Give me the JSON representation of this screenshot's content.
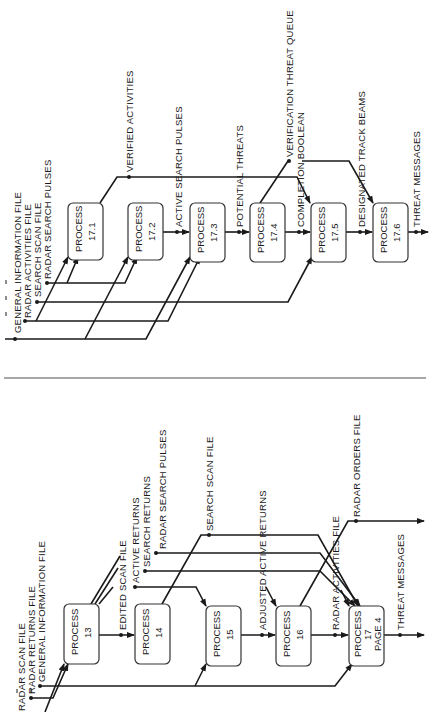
{
  "top_diagram": {
    "processes": [
      {
        "id": "17.1",
        "line1": "PROCESS",
        "line2": "17.1"
      },
      {
        "id": "17.2",
        "line1": "PROCESS",
        "line2": "17.2"
      },
      {
        "id": "17.3",
        "line1": "PROCESS",
        "line2": "17.3"
      },
      {
        "id": "17.4",
        "line1": "PROCESS",
        "line2": "17.4"
      },
      {
        "id": "17.5",
        "line1": "PROCESS",
        "line2": "17.5"
      },
      {
        "id": "17.6",
        "line1": "PROCESS",
        "line2": "17.6"
      }
    ],
    "inputs": {
      "general_information_file": "GENERAL INFORMATION FILE",
      "radar_activities_file": "RADAR ACTIVITIES FILE",
      "search_scan_file": "SEARCH SCAN FILE",
      "radar_search_pulses": "RADAR SEARCH PULSES"
    },
    "flows": {
      "verified_activities": "VERIFIED ACTIVITIES",
      "active_search_pulses": "ACTIVE SEARCH PULSES",
      "potential_threats": "POTENTIAL THREATS",
      "verification_threat_queue": "VERIFICATION THREAT QUEUE",
      "completion_boolean": "COMPLETION BOOLEAN",
      "designated_track_beams": "DESIGNATED TRACK BEAMS",
      "threat_messages": "THREAT MESSAGES"
    }
  },
  "bottom_diagram": {
    "processes": [
      {
        "id": "13",
        "line1": "PROCESS",
        "line2": "13",
        "line3": ""
      },
      {
        "id": "14",
        "line1": "PROCESS",
        "line2": "14",
        "line3": ""
      },
      {
        "id": "15",
        "line1": "PROCESS",
        "line2": "15",
        "line3": ""
      },
      {
        "id": "16",
        "line1": "PROCESS",
        "line2": "16",
        "line3": ""
      },
      {
        "id": "17",
        "line1": "PROCESS",
        "line2": "17",
        "line3": "PAGE 4"
      }
    ],
    "inputs": {
      "radar_scan_file": "RADAR SCAN FILE",
      "radar_returns_file": "RADAR RETURNS FILE",
      "general_information_file": "GENERAL INFORMATION FILE"
    },
    "flows": {
      "edited_scan_file": "EDITED SCAN FILE",
      "active_returns": "ACTIVE RETURNS",
      "search_returns": "SEARCH RETURNS",
      "radar_search_pulses": "RADAR SEARCH PULSES",
      "search_scan_file": "SEARCH SCAN FILE",
      "adjusted_active_returns": "ADJUSTED ACTIVE RETURNS",
      "radar_activities_file": "RADAR ACTIVITIES FILE",
      "radar_orders_file": "RADAR ORDERS FILE",
      "threat_messages": "THREAT MESSAGES"
    }
  }
}
